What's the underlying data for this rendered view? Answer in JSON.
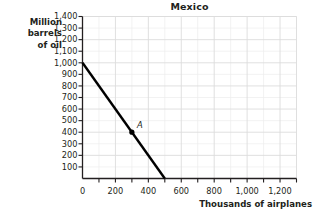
{
  "chart_data": {
    "type": "line",
    "title": "Mexico",
    "xlabel": "Thousands of airplanes",
    "ylabel": "Million barrels of oil",
    "ylabel_lines": [
      "Million",
      "barrels",
      "of oil"
    ],
    "xlim": [
      0,
      1300
    ],
    "ylim": [
      0,
      1400
    ],
    "grid": true,
    "legend": null,
    "xticks": [
      0,
      100,
      200,
      300,
      400,
      500,
      600,
      700,
      800,
      900,
      1000,
      1100,
      1200,
      1300
    ],
    "xtick_labels": [
      {
        "value": 0,
        "label": "0"
      },
      {
        "value": 200,
        "label": "200"
      },
      {
        "value": 400,
        "label": "400"
      },
      {
        "value": 600,
        "label": "600"
      },
      {
        "value": 800,
        "label": "800"
      },
      {
        "value": 1000,
        "label": "1,000"
      },
      {
        "value": 1200,
        "label": "1,200"
      }
    ],
    "yticks": [
      0,
      100,
      200,
      300,
      400,
      500,
      600,
      700,
      800,
      900,
      1000,
      1100,
      1200,
      1300,
      1400
    ],
    "ytick_labels": [
      {
        "value": 1400,
        "label": "1,400"
      },
      {
        "value": 1300,
        "label": "1,300"
      },
      {
        "value": 1200,
        "label": "1,200"
      },
      {
        "value": 1100,
        "label": "1,100"
      },
      {
        "value": 1000,
        "label": "1,000"
      },
      {
        "value": 900,
        "label": "900"
      },
      {
        "value": 800,
        "label": "800"
      },
      {
        "value": 700,
        "label": "700"
      },
      {
        "value": 600,
        "label": "600"
      },
      {
        "value": 500,
        "label": "500"
      },
      {
        "value": 400,
        "label": "400"
      },
      {
        "value": 300,
        "label": "300"
      },
      {
        "value": 200,
        "label": "200"
      },
      {
        "value": 100,
        "label": "100"
      }
    ],
    "series": [
      {
        "name": "production-possibilities-frontier",
        "type": "line",
        "x": [
          0,
          500
        ],
        "values": [
          1000,
          0
        ],
        "color": "#000000"
      }
    ],
    "annotations": [
      {
        "label": "A",
        "x": 300,
        "y": 400,
        "marker": "filled-circle",
        "color": "#000000"
      }
    ],
    "colors": {
      "line": "#000000",
      "axis": "#231f20",
      "grid_major": "#dcdcdc",
      "grid_minor": "#ededed",
      "text": "#231f20",
      "background": "#ffffff"
    }
  }
}
